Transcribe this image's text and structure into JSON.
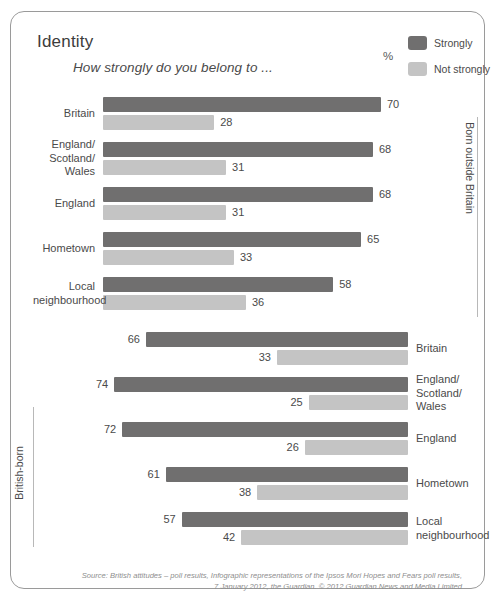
{
  "header": {
    "title": "Identity",
    "subtitle": "How strongly do you belong to ...",
    "percent_label": "%"
  },
  "legend": {
    "items": [
      {
        "label": "Strongly",
        "color": "#706f6f",
        "key": "strongly"
      },
      {
        "label": "Not strongly",
        "color": "#c4c4c4",
        "key": "not_strongly"
      }
    ]
  },
  "panels": [
    {
      "key": "born_outside_britain",
      "side_label": "Born outside Britain",
      "label_side": "left",
      "bar_direction": "ltr"
    },
    {
      "key": "british_born",
      "side_label": "British-born",
      "label_side": "right",
      "bar_direction": "rtl"
    }
  ],
  "source": {
    "line1": "Source: British attitudes – poll results, Infographic representations of the Ipsos Mori Hopes and Fears poll results,",
    "line2": "7 January 2012, the Guardian. © 2012 Guardian News and Media Limited"
  },
  "chart_data": {
    "type": "bar",
    "title": "Identity",
    "subtitle": "How strongly do you belong to ...",
    "xlabel": "",
    "ylabel": "",
    "unit": "%",
    "xlim": [
      0,
      100
    ],
    "grid": false,
    "orientation": "horizontal",
    "legend_position": "top-right",
    "legend": [
      "Strongly",
      "Not strongly"
    ],
    "categories": [
      "Britain",
      "England/\nScotland/\nWales",
      "England",
      "Hometown",
      "Local\nneighbourhood"
    ],
    "panels": [
      {
        "name": "Born outside Britain",
        "categories": [
          "Britain",
          "England/\nScotland/\nWales",
          "England",
          "Hometown",
          "Local\nneighbourhood"
        ],
        "series": [
          {
            "name": "Strongly",
            "values": [
              70,
              68,
              68,
              65,
              58
            ]
          },
          {
            "name": "Not strongly",
            "values": [
              28,
              31,
              31,
              33,
              36
            ]
          }
        ]
      },
      {
        "name": "British-born",
        "categories": [
          "Britain",
          "England/\nScotland/\nWales",
          "England",
          "Hometown",
          "Local\nneighbourhood"
        ],
        "series": [
          {
            "name": "Strongly",
            "values": [
              66,
              74,
              72,
              61,
              57
            ]
          },
          {
            "name": "Not strongly",
            "values": [
              33,
              25,
              26,
              38,
              42
            ]
          }
        ]
      }
    ]
  }
}
